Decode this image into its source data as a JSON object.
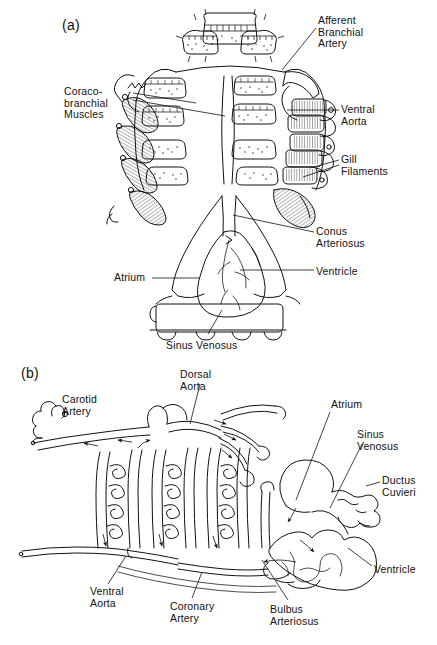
{
  "figure": {
    "title_present": false,
    "background_color": "#ffffff",
    "ink_color": "#111111",
    "panels": [
      {
        "id": "a",
        "id_label": "(a)",
        "description": "Ventral dissection of elasmobranch branchial region and heart",
        "labels": [
          {
            "name": "afferent-branchial-artery",
            "text": "Afferent\nBranchial\nArtery",
            "x": 318,
            "y": 15
          },
          {
            "name": "coraco-branchial-muscles",
            "text": "Coraco-\nbranchial\nMuscles",
            "x": 64,
            "y": 86
          },
          {
            "name": "ventral-aorta",
            "text": "Ventral\nAorta",
            "x": 341,
            "y": 104
          },
          {
            "name": "gill-filaments",
            "text": "Gill\nFilaments",
            "x": 341,
            "y": 154
          },
          {
            "name": "conus-arteriosus",
            "text": "Conus\nArteriosus",
            "x": 316,
            "y": 226
          },
          {
            "name": "ventricle",
            "text": "Ventricle",
            "x": 316,
            "y": 266
          },
          {
            "name": "atrium",
            "text": "Atrium",
            "x": 114,
            "y": 272
          },
          {
            "name": "sinus-venosus",
            "text": "Sinus  Venosus",
            "x": 166,
            "y": 340
          }
        ]
      },
      {
        "id": "b",
        "id_label": "(b)",
        "description": "Schematic of branchial circulation and heart showing direction of blood flow",
        "labels": [
          {
            "name": "carotid-artery",
            "text": "Carotid\nArtery",
            "x": 62,
            "y": 394
          },
          {
            "name": "dorsal-aorta",
            "text": "Dorsal\nAorta",
            "x": 180,
            "y": 369
          },
          {
            "name": "atrium",
            "text": "Atrium",
            "x": 331,
            "y": 399
          },
          {
            "name": "sinus-venosus",
            "text": "Sinus\nVenosus",
            "x": 357,
            "y": 429
          },
          {
            "name": "ductus-cuvieri",
            "text": "Ductus\nCuvieri",
            "x": 382,
            "y": 475
          },
          {
            "name": "ventricle",
            "text": "Ventricle",
            "x": 374,
            "y": 564
          },
          {
            "name": "ventral-aorta",
            "text": "Ventral\nAorta",
            "x": 90,
            "y": 586
          },
          {
            "name": "coronary-artery",
            "text": "Coronary\nArtery",
            "x": 170,
            "y": 601
          },
          {
            "name": "bulbus-arteriosus",
            "text": "Bulbus\nArteriosus",
            "x": 270,
            "y": 604
          }
        ]
      }
    ]
  }
}
